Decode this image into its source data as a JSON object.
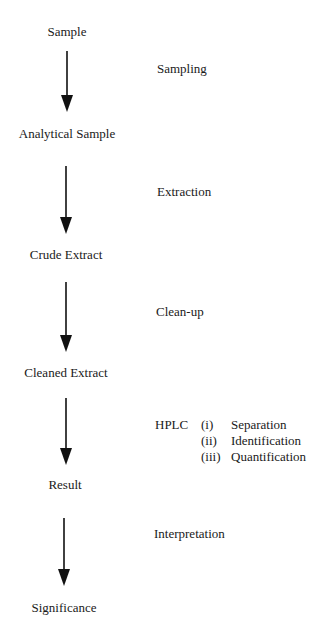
{
  "diagram": {
    "nodes": [
      {
        "label": "Sample"
      },
      {
        "label": "Analytical Sample"
      },
      {
        "label": "Crude Extract"
      },
      {
        "label": "Cleaned Extract"
      },
      {
        "label": "Result"
      },
      {
        "label": "Significance"
      }
    ],
    "steps": [
      {
        "label": "Sampling"
      },
      {
        "label": "Extraction"
      },
      {
        "label": "Clean-up"
      },
      {
        "label": "HPLC"
      },
      {
        "label": "Interpretation"
      }
    ],
    "hplc_substeps": [
      {
        "num": "(i)",
        "label": "Separation"
      },
      {
        "num": "(ii)",
        "label": "Identification"
      },
      {
        "num": "(iii)",
        "label": "Quantification"
      }
    ],
    "colors": {
      "text": "#1a1a1a",
      "arrow": "#111111",
      "background": "#ffffff"
    }
  }
}
